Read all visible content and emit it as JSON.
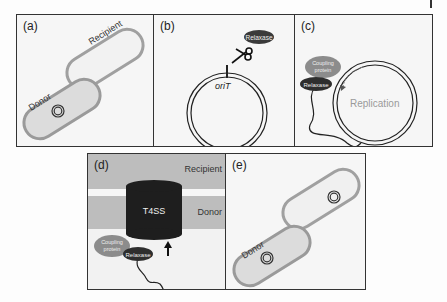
{
  "figure": {
    "panels": [
      {
        "id": "a",
        "label": "(a)",
        "cells": {
          "donor": "Donor",
          "recipient": "Recipient"
        }
      },
      {
        "id": "b",
        "label": "(b)",
        "relaxase": "Relaxase",
        "origin": "oriT"
      },
      {
        "id": "c",
        "label": "(c)",
        "coupling_protein": "Coupling protein",
        "coupling_line1": "Coupling",
        "coupling_line2": "protein",
        "relaxase": "Relaxase",
        "process": "Replication"
      },
      {
        "id": "d",
        "label": "(d)",
        "recipient": "Recipient",
        "donor": "Donor",
        "channel": "T4SS",
        "coupling_line1": "Coupling",
        "coupling_line2": "protein",
        "relaxase": "Relaxase"
      },
      {
        "id": "e",
        "label": "(e)",
        "cells": {
          "donor": "Donor"
        }
      }
    ],
    "colors": {
      "cell_border": "#9a9a9a",
      "donor_fill": "#dcdcdc",
      "recipient_fill": "#eeeeee",
      "relaxase": "#3a3a3a",
      "coupling_protein": "#8c8c8c",
      "t4ss": "#1e1e1e",
      "membrane": "#bdbdbd"
    }
  }
}
